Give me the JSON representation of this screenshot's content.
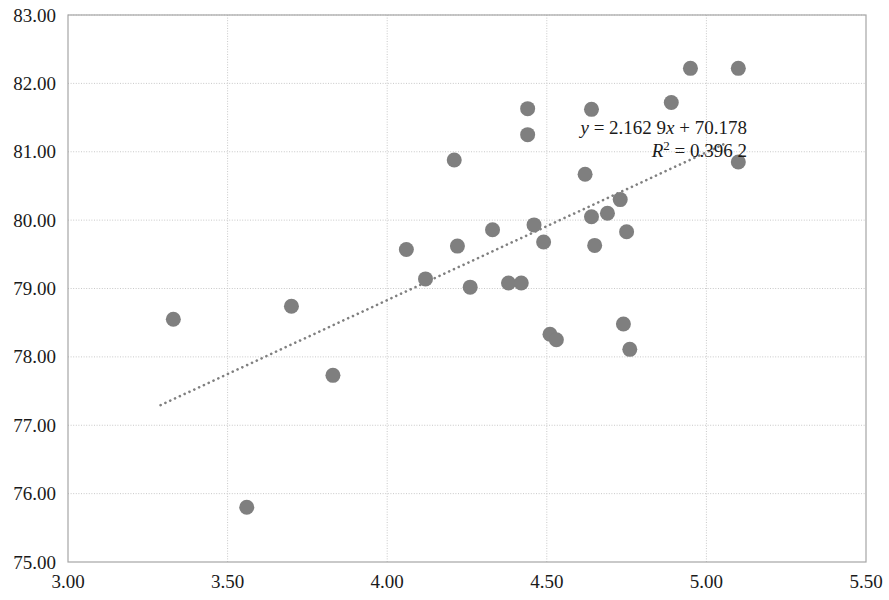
{
  "chart_data": {
    "type": "scatter",
    "title": "",
    "xlabel": "",
    "ylabel": "",
    "xlim": [
      3.0,
      5.5
    ],
    "ylim": [
      75.0,
      83.0
    ],
    "x_ticks": [
      "3.00",
      "3.50",
      "4.00",
      "4.50",
      "5.00",
      "5.50"
    ],
    "x_tick_values": [
      3.0,
      3.5,
      4.0,
      4.5,
      5.0,
      5.5
    ],
    "y_ticks": [
      "75.00",
      "76.00",
      "77.00",
      "78.00",
      "79.00",
      "80.00",
      "81.00",
      "82.00",
      "83.00"
    ],
    "y_tick_values": [
      75,
      76,
      77,
      78,
      79,
      80,
      81,
      82,
      83
    ],
    "grid": true,
    "legend": "none",
    "marker_color": "#7f7f7f",
    "marker_radius": 7.5,
    "trendline": {
      "style": "dotted",
      "color": "#808080",
      "equation": "y = 2.162 9x + 70.178",
      "r_squared_label": "R",
      "r_squared_sup": "2",
      "r_squared_value": "= 0.396 2",
      "slope": 2.1629,
      "intercept": 70.178,
      "x_start": 3.29,
      "x_end": 5.06
    },
    "points": [
      {
        "x": 3.33,
        "y": 78.55
      },
      {
        "x": 3.56,
        "y": 75.8
      },
      {
        "x": 3.7,
        "y": 78.74
      },
      {
        "x": 3.83,
        "y": 77.73
      },
      {
        "x": 4.06,
        "y": 79.57
      },
      {
        "x": 4.12,
        "y": 79.14
      },
      {
        "x": 4.21,
        "y": 80.88
      },
      {
        "x": 4.22,
        "y": 79.62
      },
      {
        "x": 4.26,
        "y": 79.02
      },
      {
        "x": 4.33,
        "y": 79.86
      },
      {
        "x": 4.38,
        "y": 79.08
      },
      {
        "x": 4.42,
        "y": 79.08
      },
      {
        "x": 4.44,
        "y": 81.63
      },
      {
        "x": 4.44,
        "y": 81.25
      },
      {
        "x": 4.46,
        "y": 79.93
      },
      {
        "x": 4.49,
        "y": 79.68
      },
      {
        "x": 4.51,
        "y": 78.33
      },
      {
        "x": 4.53,
        "y": 78.25
      },
      {
        "x": 4.62,
        "y": 80.67
      },
      {
        "x": 4.64,
        "y": 81.62
      },
      {
        "x": 4.64,
        "y": 80.05
      },
      {
        "x": 4.65,
        "y": 79.63
      },
      {
        "x": 4.69,
        "y": 80.1
      },
      {
        "x": 4.73,
        "y": 80.3
      },
      {
        "x": 4.74,
        "y": 78.48
      },
      {
        "x": 4.75,
        "y": 79.83
      },
      {
        "x": 4.76,
        "y": 78.11
      },
      {
        "x": 4.89,
        "y": 81.72
      },
      {
        "x": 4.95,
        "y": 82.22
      },
      {
        "x": 5.1,
        "y": 82.22
      },
      {
        "x": 5.1,
        "y": 80.85
      }
    ]
  },
  "plot_area": {
    "left": 68,
    "top": 15,
    "right": 866,
    "bottom": 562,
    "border_color": "#a6a6a6",
    "grid_color": "#c8c8c8"
  }
}
